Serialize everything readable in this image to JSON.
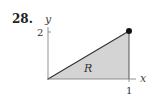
{
  "problem": {
    "number": "28."
  },
  "diagram": {
    "axes": {
      "x_label": "x",
      "y_label": "y"
    },
    "ticks": {
      "x": [
        "1"
      ],
      "y": [
        "2"
      ]
    },
    "region_label": "R",
    "region": {
      "shape": "triangle",
      "vertices": [
        [
          0,
          0
        ],
        [
          1,
          2
        ],
        [
          1,
          0
        ]
      ],
      "fill": "#d4d4d4",
      "stroke": "#333333"
    },
    "highlighted_point": {
      "coords": [
        1,
        2
      ],
      "color": "#111111"
    }
  }
}
